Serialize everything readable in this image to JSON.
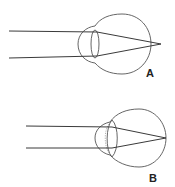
{
  "figure": {
    "panels": [
      {
        "id": "A",
        "label": "A",
        "description": "Parallel light rays focus behind the retina (eye too short)"
      },
      {
        "id": "B",
        "label": "B",
        "description": "Parallel light rays focus on the retina with adjusted lens"
      }
    ],
    "colors": {
      "outline": "#555555",
      "rays": "#3a3a3a",
      "background": "#ffffff"
    }
  }
}
